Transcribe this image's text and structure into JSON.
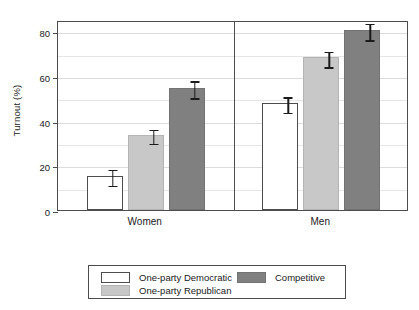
{
  "chart_data": {
    "type": "bar",
    "title": "",
    "subtitle": "",
    "xlabel": "",
    "ylabel": "Turnout (%)",
    "ylim": [
      0,
      85
    ],
    "yticks": [
      0,
      20,
      40,
      60,
      80
    ],
    "ytick_labels": [
      "0",
      "20",
      "40",
      "60",
      "80"
    ],
    "gridlines_minor": [
      10,
      30,
      50,
      70
    ],
    "grid": true,
    "legend_position": "bottom",
    "panels": [
      "Women",
      "Men"
    ],
    "categories": [
      "Women",
      "Men"
    ],
    "series": [
      {
        "name": "One-party Democratic",
        "color": "#ffffff",
        "values": [
          15.3,
          47.8
        ],
        "err_low": [
          11.8,
          44.3
        ],
        "err_high": [
          18.8,
          51.3
        ]
      },
      {
        "name": "One-party Republican",
        "color": "#c8c8c8",
        "values": [
          33.6,
          68.3
        ],
        "err_low": [
          30.5,
          64.8
        ],
        "err_high": [
          36.8,
          71.8
        ]
      },
      {
        "name": "Competitive",
        "color": "#808080",
        "values": [
          54.8,
          80.6
        ],
        "err_low": [
          50.8,
          76.8
        ],
        "err_high": [
          58.5,
          84.2
        ]
      }
    ]
  },
  "legend": {
    "entries": [
      {
        "label": "One-party Democratic",
        "swatch": "c-white"
      },
      {
        "label": "One-party Republican",
        "swatch": "c-light"
      },
      {
        "label": "Competitive",
        "swatch": "c-dark"
      }
    ]
  },
  "colors": {
    "one_party_democratic": "#ffffff",
    "one_party_republican": "#c8c8c8",
    "competitive": "#808080",
    "axis": "#4d4d4d",
    "grid": "#e6e6e6",
    "text": "#1a1a1a"
  }
}
